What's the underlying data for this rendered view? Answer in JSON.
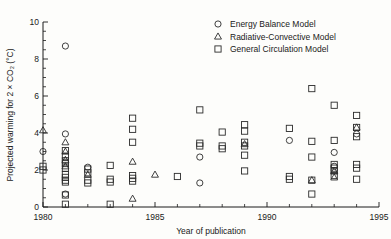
{
  "chart_data": {
    "type": "scatter",
    "title": "",
    "xlabel": "Year of publication",
    "ylabel": "Projected warming for 2 × CO₂ (°C)",
    "xlim": [
      1980,
      1995
    ],
    "ylim": [
      0,
      10
    ],
    "xticks": [
      1980,
      1985,
      1990,
      1995
    ],
    "yticks": [
      0,
      2,
      4,
      6,
      8,
      10
    ],
    "xtick_labels": [
      "1980",
      "1985",
      "1990",
      "1995"
    ],
    "ytick_labels": [
      "0",
      "2",
      "4",
      "6",
      "8",
      "10"
    ],
    "x_minor_step": 1,
    "y_minor_step": 0.5,
    "grid": false,
    "legend_position": "top-right",
    "series": [
      {
        "name": "Energy Balance Model",
        "marker": "circle",
        "points": [
          [
            1980,
            3.0
          ],
          [
            1981,
            8.7
          ],
          [
            1981,
            3.95
          ],
          [
            1981,
            0.7
          ],
          [
            1982,
            2.15
          ],
          [
            1987,
            2.7
          ],
          [
            1987,
            1.3
          ],
          [
            1991,
            3.6
          ],
          [
            1993,
            2.95
          ],
          [
            1993,
            2.2
          ],
          [
            1994,
            3.95
          ]
        ]
      },
      {
        "name": "Radiative-Convective Model",
        "marker": "triangle",
        "points": [
          [
            1980,
            4.15
          ],
          [
            1981,
            3.5
          ],
          [
            1981,
            3.0
          ],
          [
            1981,
            2.55
          ],
          [
            1981,
            2.2
          ],
          [
            1982,
            1.75
          ],
          [
            1984,
            2.45
          ],
          [
            1984,
            0.45
          ],
          [
            1985,
            1.75
          ],
          [
            1989,
            3.4
          ],
          [
            1992,
            1.45
          ],
          [
            1993,
            1.95
          ],
          [
            1993,
            1.6
          ],
          [
            1994,
            4.3
          ]
        ]
      },
      {
        "name": "General Circulation Model",
        "marker": "square",
        "points": [
          [
            1980,
            2.2
          ],
          [
            1980,
            2.0
          ],
          [
            1981,
            3.05
          ],
          [
            1981,
            2.75
          ],
          [
            1981,
            2.5
          ],
          [
            1981,
            2.35
          ],
          [
            1981,
            2.1
          ],
          [
            1981,
            1.75
          ],
          [
            1981,
            1.6
          ],
          [
            1981,
            1.45
          ],
          [
            1981,
            1.35
          ],
          [
            1981,
            0.65
          ],
          [
            1981,
            0.15
          ],
          [
            1982,
            2.05
          ],
          [
            1982,
            1.85
          ],
          [
            1982,
            1.45
          ],
          [
            1982,
            1.3
          ],
          [
            1983,
            2.25
          ],
          [
            1983,
            1.5
          ],
          [
            1983,
            1.35
          ],
          [
            1983,
            0.15
          ],
          [
            1984,
            4.8
          ],
          [
            1984,
            4.2
          ],
          [
            1984,
            3.5
          ],
          [
            1984,
            1.7
          ],
          [
            1984,
            1.55
          ],
          [
            1984,
            1.4
          ],
          [
            1986,
            1.65
          ],
          [
            1987,
            5.25
          ],
          [
            1987,
            3.45
          ],
          [
            1987,
            3.3
          ],
          [
            1988,
            4.05
          ],
          [
            1988,
            3.3
          ],
          [
            1988,
            3.15
          ],
          [
            1989,
            4.45
          ],
          [
            1989,
            4.1
          ],
          [
            1989,
            3.5
          ],
          [
            1989,
            3.3
          ],
          [
            1989,
            2.8
          ],
          [
            1989,
            1.95
          ],
          [
            1991,
            4.25
          ],
          [
            1991,
            1.65
          ],
          [
            1991,
            1.5
          ],
          [
            1992,
            6.4
          ],
          [
            1992,
            3.55
          ],
          [
            1992,
            2.7
          ],
          [
            1992,
            1.45
          ],
          [
            1992,
            0.7
          ],
          [
            1993,
            5.5
          ],
          [
            1993,
            3.6
          ],
          [
            1993,
            2.3
          ],
          [
            1993,
            2.1
          ],
          [
            1993,
            1.95
          ],
          [
            1993,
            1.7
          ],
          [
            1994,
            4.95
          ],
          [
            1994,
            4.3
          ],
          [
            1994,
            3.8
          ],
          [
            1994,
            2.3
          ],
          [
            1994,
            2.1
          ],
          [
            1994,
            1.5
          ]
        ]
      }
    ]
  },
  "legend": {
    "entries": [
      {
        "marker": "circle",
        "label": "Energy Balance Model"
      },
      {
        "marker": "triangle",
        "label": "Radiative-Convective Model"
      },
      {
        "marker": "square",
        "label": "General Circulation Model"
      }
    ]
  },
  "colors": {
    "ink": "#1a1a1a",
    "marker": "#2b2b2b",
    "background": "#fdfdfb"
  }
}
